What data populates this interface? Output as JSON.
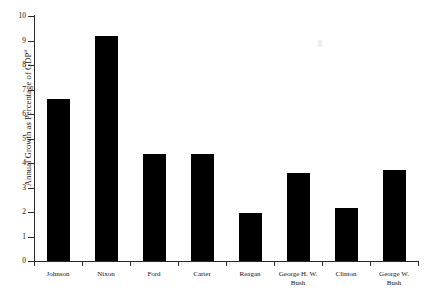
{
  "chart_data": {
    "type": "bar",
    "title": "",
    "xlabel": "",
    "ylabel": "Annual Growth as Percentage of GDP",
    "ylabel_superscript": "a",
    "ylim": [
      0,
      10
    ],
    "ytick_labels": [
      "0",
      "1",
      "2",
      "3",
      "4",
      "5",
      "6",
      "7",
      "8",
      "9",
      "10"
    ],
    "ytick_values": [
      0,
      1,
      2,
      3,
      4,
      5,
      6,
      7,
      8,
      9,
      10
    ],
    "grid": false,
    "legend": false,
    "bar_color": "#000000",
    "axis_color": "#2b2b2b",
    "background": "#ffffff",
    "categories": [
      "Johnson",
      "Nixon",
      "Ford",
      "Carter",
      "Reagan",
      "George H. W.\nBush",
      "Clinton",
      "George W.\nBush"
    ],
    "values": [
      6.6,
      9.2,
      4.35,
      4.35,
      1.95,
      3.6,
      2.15,
      3.7
    ],
    "bars": [
      {
        "label": "Johnson",
        "value": 6.6
      },
      {
        "label": "Nixon",
        "value": 9.2
      },
      {
        "label": "Ford",
        "value": 4.35
      },
      {
        "label": "Carter",
        "value": 4.35
      },
      {
        "label": "Reagan",
        "value": 1.95
      },
      {
        "label": "George H. W.\nBush",
        "value": 3.6
      },
      {
        "label": "Clinton",
        "value": 2.15
      },
      {
        "label": "George W.\nBush",
        "value": 3.7
      }
    ]
  }
}
